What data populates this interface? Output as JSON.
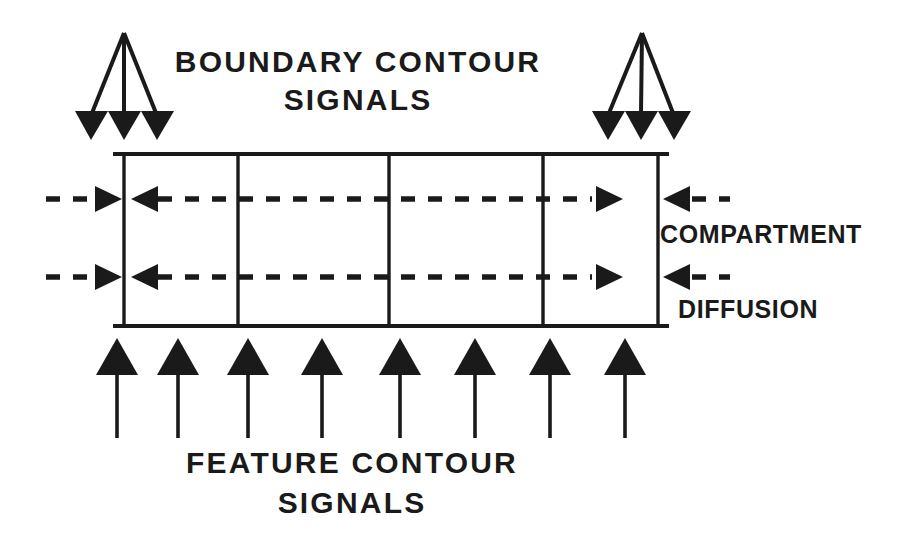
{
  "figure": {
    "title_top_line1": "BOUNDARY  CONTOUR",
    "title_top_line2": "SIGNALS",
    "title_bottom_line1": "FEATURE  CONTOUR",
    "title_bottom_line2": "SIGNALS",
    "label_right_upper": "COMPARTMENT",
    "label_right_lower": "DIFFUSION",
    "ink_color": "#1a1a1a",
    "background_color": "#ffffff"
  },
  "geometry": {
    "box": {
      "left": 124,
      "right": 658,
      "top": 154,
      "bottom": 326,
      "rule_overhang_left": 113,
      "rule_overhang_right": 669
    },
    "dividers_x": [
      238,
      389,
      543
    ],
    "diffusion_rows_y": [
      199,
      277
    ],
    "boundary_fans": [
      {
        "apex_x": 124,
        "apex_y": 33,
        "heads_x": [
          91,
          124,
          157
        ],
        "heads_y": 120
      },
      {
        "apex_x": 642,
        "apex_y": 33,
        "heads_x": [
          608,
          641,
          674
        ],
        "heads_y": 120
      }
    ],
    "feature_arrows_x": [
      117,
      178,
      248,
      322,
      400,
      475,
      550,
      625
    ],
    "feature_arrow_tip_y": 338,
    "feature_arrow_tail_y": 438
  },
  "labels": {
    "top_line1": {
      "x": 358,
      "y": 72
    },
    "top_line2": {
      "x": 358,
      "y": 110
    },
    "bottom_line1": {
      "x": 352,
      "y": 473
    },
    "bottom_line2": {
      "x": 352,
      "y": 513
    },
    "right_upper": {
      "x": 660,
      "y": 243
    },
    "right_lower": {
      "x": 678,
      "y": 318
    }
  }
}
